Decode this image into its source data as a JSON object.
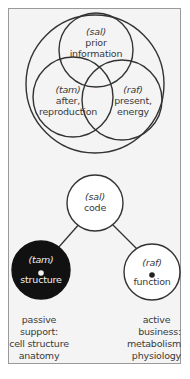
{
  "venn": {
    "top": {
      "tag": "(sal)",
      "line1": "prior",
      "line2": "information"
    },
    "left": {
      "tag": "(tam)",
      "line1": "after,",
      "line2": "reproduction"
    },
    "right": {
      "tag": "(raf)",
      "line1": "present,",
      "line2": "energy"
    }
  },
  "tree": {
    "root": {
      "tag": "(sal)",
      "label": "code"
    },
    "left": {
      "tag": "(tam)",
      "label": "structure",
      "fill": "#111111"
    },
    "right": {
      "tag": "(raf)",
      "label": "function",
      "fill": "#ffffff"
    }
  },
  "captions": {
    "left": [
      "passive",
      "support:",
      "cell structure",
      "anatomy"
    ],
    "right": [
      "active",
      "business:",
      "metabolism",
      "physiology"
    ]
  },
  "colors": {
    "stroke": "#333333",
    "frame_bg": "#f4f4f4",
    "dark_node": "#111111"
  }
}
